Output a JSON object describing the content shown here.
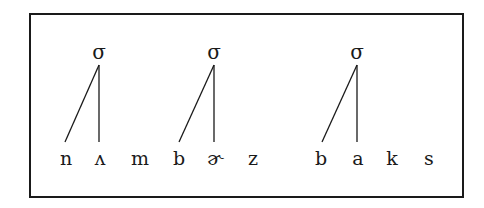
{
  "diagram": {
    "type": "syllable-structure",
    "syllables": [
      {
        "label": "σ",
        "x": 99,
        "onset_index": 0,
        "nucleus_index": 1
      },
      {
        "label": "σ",
        "x": 214,
        "onset_index": 3,
        "nucleus_index": 4
      },
      {
        "label": "σ",
        "x": 357,
        "onset_index": 6,
        "nucleus_index": 7
      }
    ],
    "segments": [
      {
        "text": "n",
        "x": 66
      },
      {
        "text": "ʌ",
        "x": 100
      },
      {
        "text": "m",
        "x": 140
      },
      {
        "text": "b",
        "x": 179
      },
      {
        "text": "ɚ",
        "x": 215
      },
      {
        "text": "z",
        "x": 253
      },
      {
        "text": "b",
        "x": 321
      },
      {
        "text": "a",
        "x": 358
      },
      {
        "text": "k",
        "x": 392
      },
      {
        "text": "s",
        "x": 429
      }
    ],
    "line_color": "#1a1a1a"
  }
}
